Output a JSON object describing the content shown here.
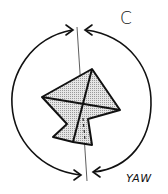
{
  "diagram": {
    "labels": {
      "top_right": "C",
      "bottom_right": "YAW"
    },
    "elements": [
      "vertical-axis-line",
      "left-rotation-arrow",
      "right-rotation-arrow",
      "kite-shape"
    ],
    "colors": {
      "stroke": "#111111",
      "kite_fill": "#d9d9d9",
      "background": "#ffffff"
    }
  }
}
